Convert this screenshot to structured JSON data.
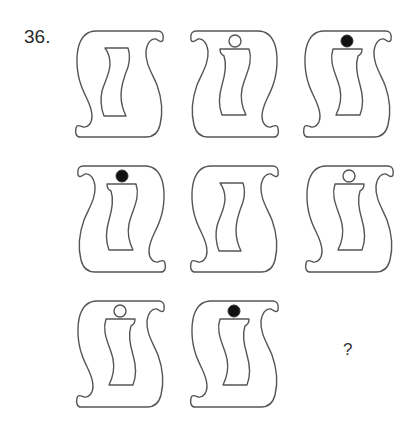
{
  "question": {
    "number": "36.",
    "answer_placeholder": "?"
  },
  "figures": [
    {
      "row": 1,
      "col": 1,
      "outer": "normal",
      "inner": "z-frame",
      "dot": "none"
    },
    {
      "row": 1,
      "col": 2,
      "outer": "mirrored",
      "inner": "i-mirrored",
      "dot": "hollow"
    },
    {
      "row": 1,
      "col": 3,
      "outer": "normal",
      "inner": "i",
      "dot": "filled"
    },
    {
      "row": 2,
      "col": 1,
      "outer": "mirrored",
      "inner": "i-mirrored",
      "dot": "filled"
    },
    {
      "row": 2,
      "col": 2,
      "outer": "normal",
      "inner": "z-frame",
      "dot": "none"
    },
    {
      "row": 2,
      "col": 3,
      "outer": "normal",
      "inner": "i",
      "dot": "hollow"
    },
    {
      "row": 3,
      "col": 1,
      "outer": "normal",
      "inner": "i",
      "dot": "hollow"
    },
    {
      "row": 3,
      "col": 2,
      "outer": "normal",
      "inner": "i",
      "dot": "filled"
    },
    {
      "row": 3,
      "col": 3,
      "outer": "unknown",
      "inner": "unknown",
      "dot": "unknown"
    }
  ],
  "colors": {
    "stroke": "#555555",
    "dot_fill": "#111111",
    "background": "#ffffff"
  }
}
